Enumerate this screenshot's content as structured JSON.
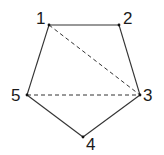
{
  "diagram": {
    "type": "pentagon",
    "vertices": [
      {
        "label": "1",
        "x": 49,
        "y": 25,
        "lx": 36,
        "ly": 24
      },
      {
        "label": "2",
        "x": 119,
        "y": 25,
        "lx": 123,
        "ly": 24
      },
      {
        "label": "3",
        "x": 140,
        "y": 95,
        "lx": 143,
        "ly": 101
      },
      {
        "label": "4",
        "x": 83,
        "y": 137,
        "lx": 86,
        "ly": 150
      },
      {
        "label": "5",
        "x": 27,
        "y": 95,
        "lx": 11,
        "ly": 101
      }
    ],
    "edges": [
      [
        1,
        2
      ],
      [
        2,
        3
      ],
      [
        3,
        4
      ],
      [
        4,
        5
      ],
      [
        5,
        1
      ]
    ],
    "diagonals": [
      [
        1,
        3
      ],
      [
        5,
        3
      ]
    ],
    "colors": {
      "stroke": "#333333",
      "text": "#1a1a1a"
    }
  }
}
